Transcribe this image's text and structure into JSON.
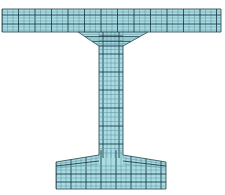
{
  "diagram": {
    "type": "mesh",
    "colors": {
      "fill": "#a9dde3",
      "grid_major": "#1f3f4a",
      "grid_minor": "#5f8e98",
      "background": "#ffffff"
    },
    "parts": [
      {
        "name": "top-flange",
        "x": [
          2,
          221
        ],
        "y": [
          9,
          32
        ]
      },
      {
        "name": "top-haunch",
        "from_x": [
          78,
          148
        ],
        "to_x": [
          99,
          123
        ],
        "y": [
          32,
          46
        ]
      },
      {
        "name": "web",
        "x": [
          99,
          123
        ],
        "y": [
          46,
          155
        ]
      },
      {
        "name": "bottom-haunch",
        "outer_x": [
          56,
          166
        ],
        "outer_y": 162,
        "web_y": 155
      },
      {
        "name": "bottom-flange",
        "x": [
          56,
          166
        ],
        "y": [
          162,
          189
        ]
      }
    ]
  }
}
